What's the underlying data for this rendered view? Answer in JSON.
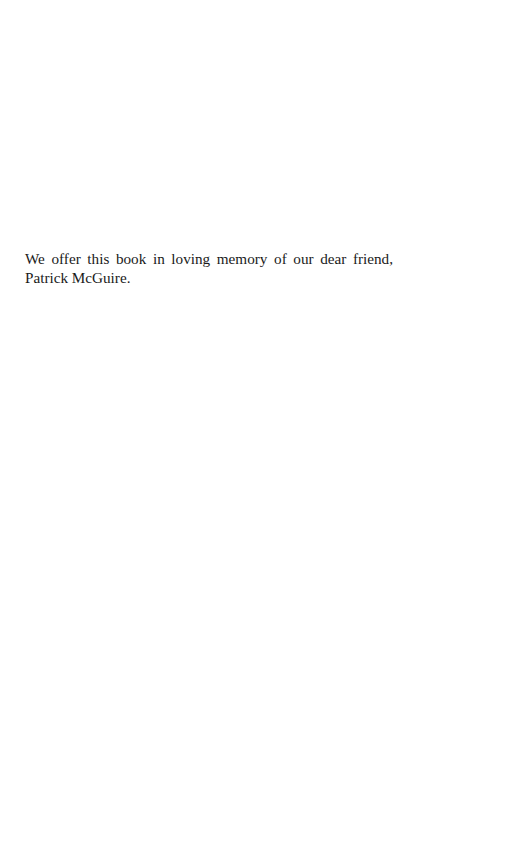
{
  "page": {
    "background_color": "#ffffff",
    "text_color": "#1a1a1a",
    "type": "dedication-page"
  },
  "dedication": {
    "full_text": "We offer this book in loving memory of our dear friend, Patrick McGuire.",
    "line_one": "We offer this book in loving memory of our dear friend,",
    "line_two": "Patrick McGuire."
  }
}
